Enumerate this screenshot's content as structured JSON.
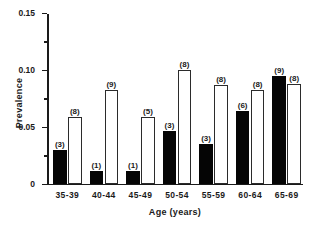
{
  "chart_data": {
    "type": "bar",
    "title": "",
    "xlabel": "Age  (years)",
    "ylabel": "Prevalence",
    "categories": [
      "35-39",
      "40-44",
      "45-49",
      "50-54",
      "55-59",
      "60-64",
      "65-69"
    ],
    "ylim": [
      0,
      0.15
    ],
    "ytick_labels": [
      "0",
      "0.05",
      "0.10",
      "0.15"
    ],
    "ytick_values": [
      0,
      0.05,
      0.1,
      0.15
    ],
    "yminor_values": [
      0.025,
      0.075,
      0.125
    ],
    "grid": false,
    "legend": "none",
    "series": [
      {
        "name": "filled",
        "style": "filled-black",
        "values": [
          0.029,
          0.011,
          0.011,
          0.046,
          0.035,
          0.064,
          0.094
        ],
        "point_labels": [
          "(3)",
          "(1)",
          "(1)",
          "(3)",
          "(3)",
          "(6)",
          "(9)"
        ]
      },
      {
        "name": "open",
        "style": "open-white",
        "values": [
          0.058,
          0.082,
          0.058,
          0.1,
          0.086,
          0.082,
          0.087
        ],
        "point_labels": [
          "(8)",
          "(9)",
          "(5)",
          "(8)",
          "(8)",
          "(8)",
          "(8)"
        ]
      }
    ]
  },
  "colors": {
    "filled_bar": "#050505",
    "open_bar_border": "#2b2b2b",
    "axis": "#1a1a1a",
    "background": "#ffffff"
  },
  "caption_sliver": ""
}
